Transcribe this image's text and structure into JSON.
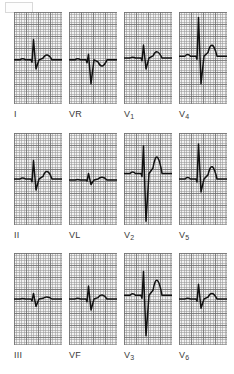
{
  "figure": {
    "type": "ecg-12-lead",
    "corner_mark": "",
    "background_color": "#ffffff",
    "paper_color": "#f2f2f2",
    "grid_minor_color": "#969696",
    "grid_major_color": "#6e6e6e",
    "trace_color": "#111111",
    "rows": 3,
    "columns": 4,
    "panel_width_px": 48,
    "panel_height_px": 92
  },
  "leads": [
    {
      "id": "I",
      "label": "I",
      "sub": "",
      "row": 0,
      "col": 0,
      "description": "low-amplitude QRS with small R wave and broad low T wave",
      "baseline_pct": 52,
      "r_amplitude_pct": 22,
      "s_amplitude_pct": 10,
      "t_amplitude_pct": 7
    },
    {
      "id": "VR",
      "label": "VR",
      "sub": "",
      "row": 0,
      "col": 1,
      "description": "predominantly negative QRS with inverted T wave (aVR)",
      "baseline_pct": 52,
      "r_amplitude_pct": 6,
      "s_amplitude_pct": 26,
      "t_amplitude_pct": -9
    },
    {
      "id": "V1",
      "label": "V",
      "sub": "1",
      "row": 0,
      "col": 2,
      "description": "small rS with notched r and low rounded T wave",
      "baseline_pct": 50,
      "r_amplitude_pct": 14,
      "s_amplitude_pct": 12,
      "t_amplitude_pct": 9
    },
    {
      "id": "V4",
      "label": "V",
      "sub": "4",
      "row": 0,
      "col": 3,
      "description": "tall R wave with deep S wave and peaked T wave, high voltage",
      "baseline_pct": 48,
      "r_amplitude_pct": 42,
      "s_amplitude_pct": 30,
      "t_amplitude_pct": 16
    },
    {
      "id": "II",
      "label": "II",
      "sub": "",
      "row": 1,
      "col": 0,
      "description": "narrow QRS with small S and upright rounded T wave",
      "baseline_pct": 50,
      "r_amplitude_pct": 20,
      "s_amplitude_pct": 12,
      "t_amplitude_pct": 11
    },
    {
      "id": "VL",
      "label": "VL",
      "sub": "",
      "row": 1,
      "col": 1,
      "description": "very low-amplitude complexes, nearly isoelectric (aVL)",
      "baseline_pct": 51,
      "r_amplitude_pct": 7,
      "s_amplitude_pct": 5,
      "t_amplitude_pct": 4
    },
    {
      "id": "V2",
      "label": "V",
      "sub": "2",
      "row": 1,
      "col": 2,
      "description": "very deep S wave with tall peaked T wave, markedly high voltage",
      "baseline_pct": 44,
      "r_amplitude_pct": 30,
      "s_amplitude_pct": 52,
      "t_amplitude_pct": 24
    },
    {
      "id": "V5",
      "label": "V",
      "sub": "5",
      "row": 1,
      "col": 3,
      "description": "tall R wave with broad dome-shaped T wave",
      "baseline_pct": 50,
      "r_amplitude_pct": 38,
      "s_amplitude_pct": 14,
      "t_amplitude_pct": 18
    },
    {
      "id": "III",
      "label": "III",
      "sub": "",
      "row": 2,
      "col": 0,
      "description": "very low-amplitude, almost flat baseline with tiny deflections",
      "baseline_pct": 50,
      "r_amplitude_pct": 6,
      "s_amplitude_pct": 8,
      "t_amplitude_pct": 3
    },
    {
      "id": "VF",
      "label": "VF",
      "sub": "",
      "row": 2,
      "col": 1,
      "description": "small qR complex with low T wave (aVF)",
      "baseline_pct": 50,
      "r_amplitude_pct": 14,
      "s_amplitude_pct": 12,
      "t_amplitude_pct": 6
    },
    {
      "id": "V3",
      "label": "V",
      "sub": "3",
      "row": 2,
      "col": 2,
      "description": "deep S wave with tall peaked T wave, high voltage",
      "baseline_pct": 46,
      "r_amplitude_pct": 26,
      "s_amplitude_pct": 44,
      "t_amplitude_pct": 22
    },
    {
      "id": "V6",
      "label": "V",
      "sub": "6",
      "row": 2,
      "col": 3,
      "description": "modest QRS with small upright T wave",
      "baseline_pct": 50,
      "r_amplitude_pct": 16,
      "s_amplitude_pct": 10,
      "t_amplitude_pct": 8
    }
  ],
  "chart_data": {
    "type": "line",
    "subtitle": "",
    "xlabel": "",
    "ylabel": "",
    "grid": true,
    "legend_position": "below each panel",
    "x_unit": "time (ECG paper, 25 mm/s)",
    "y_unit": "voltage (ECG paper, 10 mm/mV)",
    "panel_layout": {
      "rows": 3,
      "columns": 4
    },
    "categories": [
      "I",
      "VR",
      "V1",
      "V4",
      "II",
      "VL",
      "V2",
      "V5",
      "III",
      "VF",
      "V3",
      "V6"
    ],
    "series": [
      {
        "name": "I",
        "r_mm": 4.5,
        "s_mm": 2.0,
        "t_mm": 1.5,
        "qrs_polarity": "positive"
      },
      {
        "name": "VR",
        "r_mm": 1.0,
        "s_mm": 5.0,
        "t_mm": -2.0,
        "qrs_polarity": "negative"
      },
      {
        "name": "V1",
        "r_mm": 3.0,
        "s_mm": 2.5,
        "t_mm": 2.0,
        "qrs_polarity": "biphasic"
      },
      {
        "name": "V4",
        "r_mm": 9.0,
        "s_mm": 6.0,
        "t_mm": 3.5,
        "qrs_polarity": "positive"
      },
      {
        "name": "II",
        "r_mm": 4.0,
        "s_mm": 2.5,
        "t_mm": 2.5,
        "qrs_polarity": "positive"
      },
      {
        "name": "VL",
        "r_mm": 1.5,
        "s_mm": 1.0,
        "t_mm": 0.8,
        "qrs_polarity": "isoelectric"
      },
      {
        "name": "V2",
        "r_mm": 6.5,
        "s_mm": 11.0,
        "t_mm": 5.0,
        "qrs_polarity": "negative"
      },
      {
        "name": "V5",
        "r_mm": 8.0,
        "s_mm": 3.0,
        "t_mm": 4.0,
        "qrs_polarity": "positive"
      },
      {
        "name": "III",
        "r_mm": 1.2,
        "s_mm": 1.6,
        "t_mm": 0.6,
        "qrs_polarity": "isoelectric"
      },
      {
        "name": "VF",
        "r_mm": 3.0,
        "s_mm": 2.5,
        "t_mm": 1.2,
        "qrs_polarity": "positive"
      },
      {
        "name": "V3",
        "r_mm": 5.5,
        "s_mm": 9.0,
        "t_mm": 4.5,
        "qrs_polarity": "negative"
      },
      {
        "name": "V6",
        "r_mm": 3.5,
        "s_mm": 2.0,
        "t_mm": 1.8,
        "qrs_polarity": "positive"
      }
    ]
  }
}
